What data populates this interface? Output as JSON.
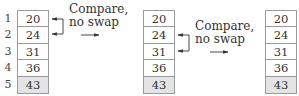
{
  "indices": [
    "1",
    "2",
    "3",
    "4",
    "5"
  ],
  "tables": [
    {
      "values": [
        "20",
        "24",
        "31",
        "36",
        "43"
      ],
      "sorted_index": 4
    },
    {
      "values": [
        "20",
        "24",
        "31",
        "36",
        "43"
      ],
      "sorted_index": 4
    },
    {
      "values": [
        "20",
        "24",
        "31",
        "36",
        "43"
      ],
      "sorted_index": 4
    }
  ],
  "steps": [
    {
      "line1": "Compare,",
      "line2": "no swap",
      "compared_rows": [
        1,
        2
      ]
    },
    {
      "line1": "Compare,",
      "line2": "no swap",
      "compared_rows": [
        2,
        3
      ]
    }
  ],
  "colors": {
    "border": "#9a9a9a",
    "sorted_fill": "#e4e4e4",
    "arrow": "#333333"
  }
}
